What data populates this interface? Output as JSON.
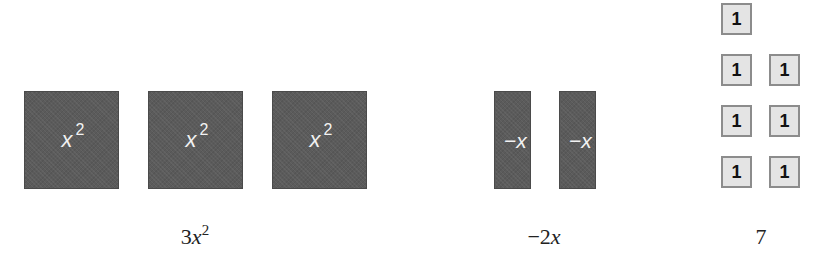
{
  "groups": [
    {
      "name": "x-squared-group",
      "label": {
        "coef": "3",
        "var": "x",
        "exp": "2"
      },
      "tiles": [
        {
          "var": "x",
          "exp": "2"
        },
        {
          "var": "x",
          "exp": "2"
        },
        {
          "var": "x",
          "exp": "2"
        }
      ]
    },
    {
      "name": "negative-x-group",
      "label": {
        "coef": "−2",
        "var": "x",
        "exp": ""
      },
      "tiles": [
        {
          "text": "−x"
        },
        {
          "text": "−x"
        }
      ]
    },
    {
      "name": "unit-group",
      "label": {
        "coef": "7",
        "var": "",
        "exp": ""
      },
      "tiles": [
        {
          "text": "1"
        },
        {
          "text": "1"
        },
        {
          "text": "1"
        },
        {
          "text": "1"
        },
        {
          "text": "1"
        },
        {
          "text": "1"
        },
        {
          "text": "1"
        }
      ]
    }
  ],
  "colors": {
    "dark_tile": "#5b5b5b",
    "unit_tile": "#e4e4e4",
    "unit_border": "#8c8c8c",
    "tile_text": "#f2f2f2"
  }
}
